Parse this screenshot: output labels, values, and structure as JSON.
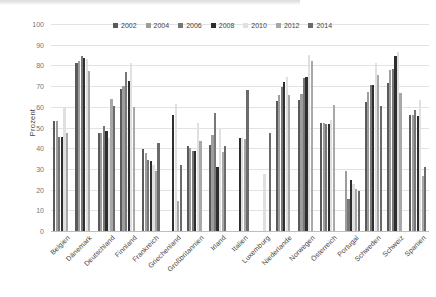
{
  "chart_data": {
    "type": "bar",
    "title": "",
    "subtitle": "",
    "xlabel": "",
    "ylabel": "Prozent",
    "ylim": [
      0,
      100
    ],
    "ytick_step": 10,
    "yticks": [
      "100",
      "90",
      "80",
      "70",
      "60",
      "50",
      "40",
      "30",
      "20",
      "10",
      "0"
    ],
    "grid": true,
    "grid_axis": "y",
    "legend_position": "top-center",
    "categories": [
      "Belgien",
      "Dänemark",
      "Deutschland",
      "Finnland",
      "Frankreich",
      "Griechenland",
      "Großbritannien",
      "Irland",
      "Italien",
      "Luxemburg",
      "Niederlande",
      "Norwegen",
      "Österreich",
      "Portugal",
      "Schweden",
      "Schweiz",
      "Spanien"
    ],
    "series": [
      {
        "name": "2002",
        "color": "#5a5a5a",
        "values": [
          53.0,
          81.0,
          47.5,
          68.5,
          39.5,
          null,
          41.0,
          41.5,
          null,
          null,
          63.0,
          63.5,
          52.0,
          null,
          62.5,
          71.5,
          56.0
        ]
      },
      {
        "name": "2004",
        "color": "#9d9d9d",
        "values": [
          53.0,
          82.0,
          47.5,
          70.0,
          37.5,
          null,
          40.0,
          46.5,
          null,
          null,
          65.5,
          66.0,
          52.0,
          29.0,
          67.0,
          78.0,
          56.0
        ]
      },
      {
        "name": "2006",
        "color": "#777777",
        "values": [
          45.5,
          84.5,
          50.5,
          77.0,
          34.5,
          null,
          38.5,
          57.0,
          null,
          null,
          69.5,
          74.0,
          51.5,
          15.5,
          70.5,
          78.5,
          58.5
        ]
      },
      {
        "name": "2008",
        "color": "#2e2e2e",
        "values": [
          45.5,
          83.5,
          48.5,
          72.5,
          34.0,
          56.0,
          38.5,
          31.0,
          45.0,
          null,
          72.0,
          74.5,
          51.5,
          24.5,
          70.5,
          84.5,
          55.5
        ]
      },
      {
        "name": "2010",
        "color": "#e0e0e0",
        "values": [
          60.0,
          83.0,
          45.0,
          81.0,
          32.0,
          61.5,
          52.0,
          49.5,
          45.0,
          27.5,
          74.5,
          85.0,
          53.5,
          22.5,
          81.0,
          86.5,
          63.5
        ]
      },
      {
        "name": "2012",
        "color": "#a8a8a8",
        "values": [
          47.5,
          77.5,
          64.0,
          60.0,
          29.0,
          14.5,
          43.5,
          38.0,
          44.5,
          null,
          65.5,
          82.0,
          61.0,
          20.5,
          75.5,
          66.5,
          26.5
        ]
      },
      {
        "name": "2014",
        "color": "#6b6b6b",
        "values": [
          null,
          null,
          60.5,
          null,
          42.5,
          32.0,
          null,
          41.0,
          68.0,
          47.5,
          null,
          null,
          null,
          19.5,
          60.5,
          null,
          31.0
        ]
      }
    ]
  },
  "legend": {
    "items": [
      {
        "label": "2002",
        "color": "#5a5a5a"
      },
      {
        "label": "2004",
        "color": "#9d9d9d"
      },
      {
        "label": "2006",
        "color": "#777777"
      },
      {
        "label": "2008",
        "color": "#2e2e2e"
      },
      {
        "label": "2010",
        "color": "#e0e0e0"
      },
      {
        "label": "2012",
        "color": "#a8a8a8"
      },
      {
        "label": "2014",
        "color": "#6b6b6b"
      }
    ]
  }
}
